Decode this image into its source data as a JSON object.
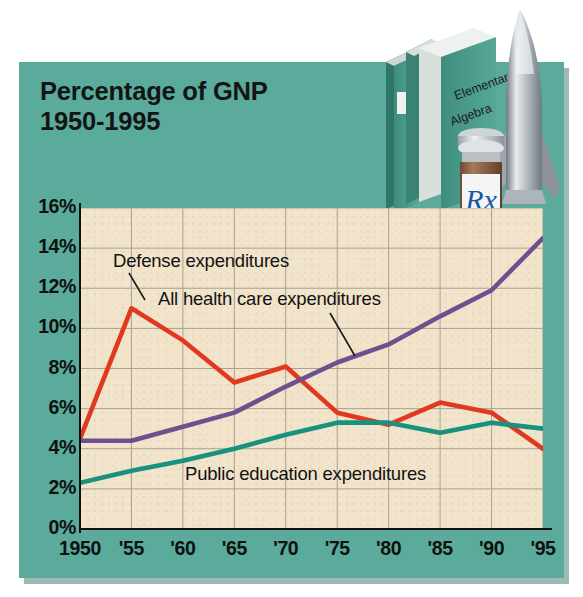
{
  "title": {
    "line1": "Percentage of GNP",
    "line2": "1950-1995"
  },
  "artwork": {
    "book_line1": "Elementary",
    "book_line2": "Algebra",
    "pill_bottle_label": "Rx",
    "items": [
      "textbooks",
      "pill-bottle",
      "missile"
    ]
  },
  "colors": {
    "panel_teal": "#5aab9b",
    "plot_cream": "#f1e4cb",
    "defense_red": "#e0391f",
    "health_purple": "#6f4f8e",
    "education_teal": "#19917f",
    "text": "#101010",
    "grid": "#a9a093"
  },
  "annotations": {
    "defense": "Defense expenditures",
    "health": "All health care expenditures",
    "education": "Public education expenditures"
  },
  "chart_data": {
    "type": "line",
    "title": "Percentage of GNP 1950-1995",
    "xlabel": "",
    "ylabel": "",
    "xlim": [
      1950,
      1995
    ],
    "ylim": [
      0,
      16
    ],
    "grid": true,
    "legend": "inline-annotations",
    "x": [
      1950,
      1955,
      1960,
      1965,
      1970,
      1975,
      1980,
      1985,
      1990,
      1995
    ],
    "tick_labels_x": [
      "1950",
      "'55",
      "'60",
      "'65",
      "'70",
      "'75",
      "'80",
      "'85",
      "'90",
      "'95"
    ],
    "tick_labels_y": [
      "0%",
      "2%",
      "4%",
      "6%",
      "8%",
      "10%",
      "12%",
      "14%",
      "16%"
    ],
    "tick_values_y": [
      0,
      2,
      4,
      6,
      8,
      10,
      12,
      14,
      16
    ],
    "series": [
      {
        "name": "Defense expenditures",
        "color": "#e0391f",
        "values": [
          4.5,
          11.0,
          9.4,
          7.3,
          8.1,
          5.8,
          5.2,
          6.3,
          5.8,
          4.0
        ]
      },
      {
        "name": "All health care expenditures",
        "color": "#6f4f8e",
        "values": [
          4.4,
          4.4,
          5.1,
          5.8,
          7.1,
          8.3,
          9.2,
          10.6,
          11.9,
          14.5
        ]
      },
      {
        "name": "Public education expenditures",
        "color": "#19917f",
        "values": [
          2.3,
          2.9,
          3.4,
          4.0,
          4.7,
          5.3,
          5.3,
          4.8,
          5.3,
          5.0
        ]
      }
    ]
  }
}
